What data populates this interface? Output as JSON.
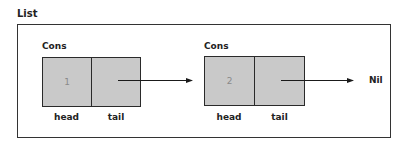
{
  "diagram": {
    "title": "List",
    "nodes": [
      {
        "type_label": "Cons",
        "head_value": "1",
        "head_label": "head",
        "tail_label": "tail"
      },
      {
        "type_label": "Cons",
        "head_value": "2",
        "head_label": "head",
        "tail_label": "tail"
      }
    ],
    "terminal": "Nil",
    "edges": [
      {
        "from": "node-1-tail",
        "to": "node-2"
      },
      {
        "from": "node-2-tail",
        "to": "Nil"
      }
    ]
  },
  "colors": {
    "cell_fill": "#c9c9c9",
    "border": "#2a2a2a",
    "value_text": "#8a8a8a",
    "label_text": "#222222"
  }
}
